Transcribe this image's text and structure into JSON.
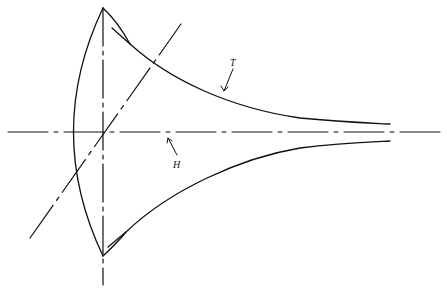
{
  "figure": {
    "labels": {
      "tractrix": "T",
      "axis": "H"
    },
    "colors": {
      "ink": "#111111",
      "background": "#ffffff"
    }
  }
}
